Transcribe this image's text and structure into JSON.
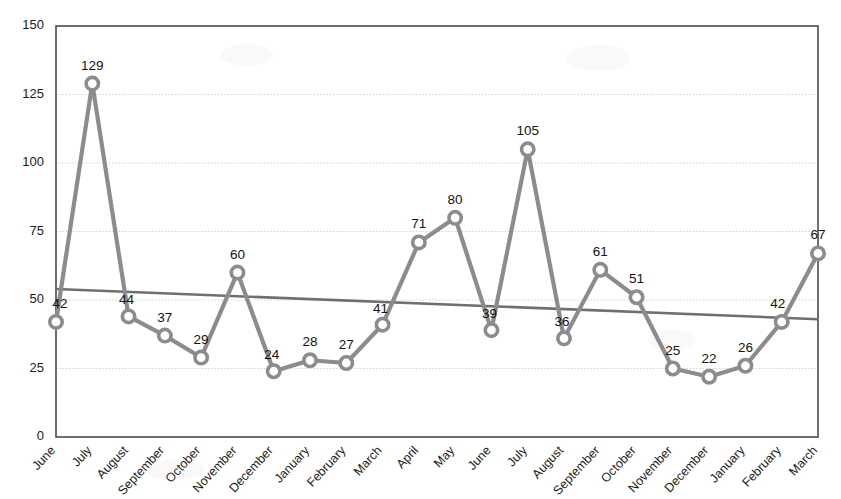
{
  "chart_data": {
    "type": "line",
    "title": "",
    "xlabel": "",
    "ylabel": "",
    "ylim": [
      0,
      150
    ],
    "yticks": [
      0,
      25,
      50,
      75,
      100,
      125,
      150
    ],
    "grid": true,
    "legend": "none",
    "categories": [
      "June",
      "July",
      "August",
      "September",
      "October",
      "November",
      "December",
      "January",
      "February",
      "March",
      "April",
      "May",
      "June",
      "July",
      "August",
      "September",
      "October",
      "November",
      "December",
      "January",
      "February",
      "March"
    ],
    "values": [
      42,
      129,
      44,
      37,
      29,
      60,
      24,
      28,
      27,
      41,
      71,
      80,
      39,
      105,
      36,
      61,
      51,
      25,
      22,
      26,
      42,
      67
    ],
    "data_labels": [
      "42",
      "129",
      "44",
      "37",
      "29",
      "60",
      "24",
      "28",
      "27",
      "41",
      "71",
      "80",
      "39",
      "105",
      "36",
      "61",
      "51",
      "25",
      "22",
      "26",
      "42",
      "67"
    ],
    "series": [
      {
        "name": "series-1",
        "marker": "open-circle",
        "color": "#8c8c8c",
        "values": [
          42,
          129,
          44,
          37,
          29,
          60,
          24,
          28,
          27,
          41,
          71,
          80,
          39,
          105,
          36,
          61,
          51,
          25,
          22,
          26,
          42,
          67
        ]
      }
    ],
    "trendline": {
      "name": "linear-trend",
      "color": "#6f6f6f",
      "start_value": 54,
      "end_value": 43
    },
    "ytick_labels": [
      "0",
      "25",
      "50",
      "75",
      "100",
      "125",
      "150"
    ]
  }
}
